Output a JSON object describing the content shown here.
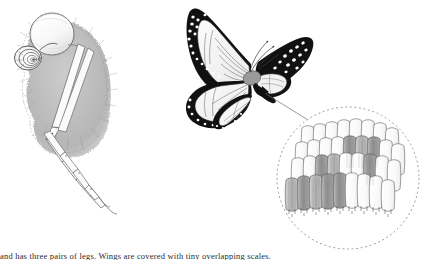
{
  "figure": {
    "background_color": "#ffffff",
    "ink_color": "#3a3a3a",
    "black": "#111111",
    "scale_fill_light": "#fdfdfd",
    "scale_fill_dark": "#8c8c8c",
    "scale_fill_mid": "#a8a8a8",
    "leader_color": "#6e6e6e",
    "dash_color": "#8a8a8a"
  },
  "panels": [
    {
      "id": "head-panel",
      "name": "butterfly-head-illustration",
      "label": "Butterfly head with compound eye, coiled proboscis and legs",
      "parts": [
        {
          "name": "compound-eye",
          "label": "Compound eye"
        },
        {
          "name": "coiled-proboscis",
          "label": "Coiled proboscis"
        },
        {
          "name": "hairy-thorax",
          "label": "Scaled thorax"
        },
        {
          "name": "foreleg",
          "label": "Foreleg"
        },
        {
          "name": "midleg",
          "label": "Midleg"
        }
      ]
    },
    {
      "id": "butterfly-panel",
      "name": "monarch-butterfly-illustration",
      "label": "Monarch butterfly, dorsal view",
      "parts": [
        {
          "name": "left-forewing",
          "label": "Left forewing"
        },
        {
          "name": "left-hindwing",
          "label": "Left hindwing"
        },
        {
          "name": "right-forewing",
          "label": "Right forewing"
        },
        {
          "name": "right-hindwing",
          "label": "Right hindwing"
        },
        {
          "name": "abdomen",
          "label": "Abdomen"
        },
        {
          "name": "antenna",
          "label": "Antenna"
        },
        {
          "name": "wing-veins",
          "label": "Wing veins"
        },
        {
          "name": "white-marginal-spots",
          "label": "White marginal spots"
        }
      ]
    },
    {
      "id": "detail-panel",
      "name": "wing-scale-detail-circle",
      "label": "Magnified detail of overlapping wing scales",
      "border_style": "dashed-circle",
      "parts": [
        {
          "name": "overlapping-scales",
          "label": "Overlapping scales"
        },
        {
          "name": "scale-pedicels",
          "label": "Scale pedicels"
        }
      ]
    }
  ],
  "callout": {
    "name": "detail-leader-line",
    "label": "Leader line from butterfly body to magnified scale detail",
    "arrow_label": "Arrowhead at sampling point on wing base"
  },
  "caption": {
    "name": "figure-caption",
    "text": "and has three pairs of legs. Wings are covered with tiny overlapping scales."
  }
}
